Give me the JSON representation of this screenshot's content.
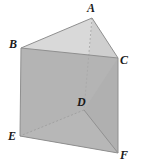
{
  "figure": {
    "name": "triangular-prism",
    "background_color": "#ffffff",
    "stroke_color": "#8f8f8f",
    "hidden_stroke_color": "#a8a8a8",
    "label_color": "#1a1a1a",
    "faces": {
      "top_left": {
        "name": "face-ABD-top-left",
        "fill": "#d9d9d9"
      },
      "top_right": {
        "name": "face-ACD-top-right",
        "fill": "#cfcfcf"
      },
      "front_left": {
        "name": "face-BEFC-front",
        "fill": "#b4b4b4"
      },
      "right": {
        "name": "face-CFD-right",
        "fill": "#b0b0b0"
      },
      "bottom_left": {
        "name": "face-DEF-bottom",
        "fill": "#b7b7b7"
      }
    },
    "vertices": [
      {
        "id": "A",
        "label": "A",
        "x": 92,
        "y": 18,
        "label_x": 87,
        "label_y": 2,
        "hidden": false
      },
      {
        "id": "B",
        "label": "B",
        "x": 21,
        "y": 48,
        "label_x": 9,
        "label_y": 38,
        "hidden": false
      },
      {
        "id": "C",
        "label": "C",
        "x": 118,
        "y": 58,
        "label_x": 120,
        "label_y": 54,
        "hidden": false
      },
      {
        "id": "D",
        "label": "D",
        "x": 84,
        "y": 110,
        "label_x": 77,
        "label_y": 96,
        "hidden": true
      },
      {
        "id": "E",
        "label": "E",
        "x": 20,
        "y": 136,
        "label_x": 8,
        "label_y": 130,
        "hidden": false
      },
      {
        "id": "F",
        "label": "F",
        "x": 118,
        "y": 153,
        "label_x": 120,
        "label_y": 149,
        "hidden": false
      }
    ],
    "edges": [
      {
        "id": "AB",
        "from": "A",
        "to": "B",
        "style": "solid"
      },
      {
        "id": "AC",
        "from": "A",
        "to": "C",
        "style": "solid"
      },
      {
        "id": "BC",
        "from": "B",
        "to": "C",
        "style": "solid"
      },
      {
        "id": "BE",
        "from": "B",
        "to": "E",
        "style": "solid"
      },
      {
        "id": "CF",
        "from": "C",
        "to": "F",
        "style": "solid"
      },
      {
        "id": "EF",
        "from": "E",
        "to": "F",
        "style": "solid"
      },
      {
        "id": "AD",
        "from": "A",
        "to": "D",
        "style": "dashed"
      },
      {
        "id": "DE",
        "from": "D",
        "to": "E",
        "style": "dashed"
      },
      {
        "id": "DF",
        "from": "D",
        "to": "F",
        "style": "solid"
      }
    ]
  }
}
